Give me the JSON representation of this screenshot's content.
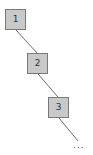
{
  "diagram": {
    "type": "linked-list-chain",
    "colors": {
      "node_fill": "#c9c9c9",
      "node_border": "#7a7a7a",
      "edge": "#6e6e6e",
      "text": "#333333"
    },
    "nodes": [
      {
        "label": "1"
      },
      {
        "label": "2"
      },
      {
        "label": "3"
      }
    ],
    "continuation": "..."
  }
}
